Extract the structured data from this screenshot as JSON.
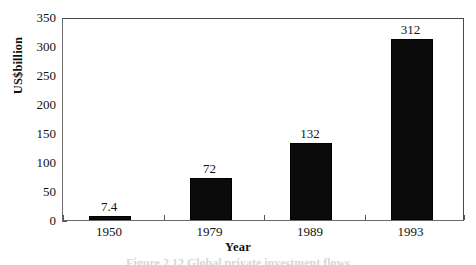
{
  "chart_data": {
    "type": "bar",
    "title": "",
    "xlabel": "Year",
    "ylabel": "US$billion",
    "categories": [
      "1950",
      "1979",
      "1989",
      "1993"
    ],
    "values": [
      7.4,
      72,
      132,
      312
    ],
    "value_labels": [
      "7.4",
      "72",
      "132",
      "312"
    ],
    "ylim": [
      0,
      350
    ],
    "ytick_step": 50,
    "yticks": [
      0,
      50,
      100,
      150,
      200,
      250,
      300,
      350
    ],
    "ytick_labels": [
      "0",
      "50",
      "100",
      "150",
      "200",
      "250",
      "300",
      "350"
    ],
    "grid": false,
    "legend": false,
    "legend_position": "none",
    "bar_color": "#0b0b0b",
    "axis_color": "#555555",
    "background_color": "#ffffff",
    "series": [
      {
        "name": "US$billion",
        "values": [
          7.4,
          72,
          132,
          312
        ]
      }
    ]
  },
  "caption": {
    "text": "Figure 2.12  Global private investment flows"
  }
}
